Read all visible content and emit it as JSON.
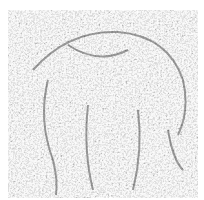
{
  "image": {
    "description": "Grayscale noise texture with a faint hidden outline of a large animal-like shape",
    "background_color": "#ffffff",
    "noise_dark": "#1a1a1a",
    "noise_light": "#f2f2f2",
    "outline_color": "#2a2a2a"
  }
}
